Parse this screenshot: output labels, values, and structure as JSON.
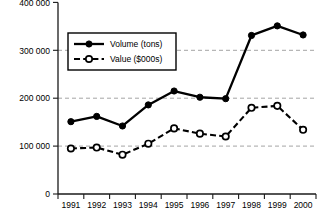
{
  "chart_data": {
    "type": "line",
    "title": "",
    "xlabel": "",
    "ylabel": "",
    "categories": [
      "1991",
      "1992",
      "1993",
      "1994",
      "1995",
      "1996",
      "1997",
      "1998",
      "1999",
      "2000"
    ],
    "series": [
      {
        "name": "Volume (tons)",
        "marker": "filled-circle",
        "linestyle": "solid",
        "color": "#000000",
        "values": [
          151000,
          162000,
          142000,
          186000,
          215000,
          202000,
          199000,
          331000,
          351000,
          332000
        ]
      },
      {
        "name": "Value ($000s)",
        "marker": "open-circle",
        "linestyle": "dashed",
        "color": "#000000",
        "values": [
          95000,
          97000,
          82000,
          105000,
          137000,
          126000,
          120000,
          180000,
          184000,
          134000
        ]
      }
    ],
    "ylim": [
      0,
      400000
    ],
    "yticks": [
      0,
      100000,
      200000,
      300000,
      400000
    ],
    "ytick_labels": [
      "0",
      "100 000",
      "200 000",
      "300 000",
      "400 000"
    ],
    "xtick_labels": [
      "1991",
      "1992",
      "1993",
      "1994",
      "1995",
      "1996",
      "1997",
      "1998",
      "1999",
      "2000"
    ],
    "grid": "horizontal-dashed",
    "legend_position": "upper-left-inside",
    "legend_entries": [
      "Volume (tons)",
      "Value ($000s)"
    ]
  },
  "axis": {
    "y_labels": {
      "t400": "400 000",
      "t300": "300 000",
      "t200": "200 000",
      "t100": "100 000",
      "t0": "0"
    },
    "x_labels": {
      "x1991": "1991",
      "x1992": "1992",
      "x1993": "1993",
      "x1994": "1994",
      "x1995": "1995",
      "x1996": "1996",
      "x1997": "1997",
      "x1998": "1998",
      "x1999": "1999",
      "x2000": "2000"
    }
  },
  "legend": {
    "volume_label": "Volume (tons)",
    "value_label": "Value ($000s)"
  },
  "colors": {
    "series": "#000000",
    "grid": "#9a9a9a",
    "axis": "#1a1a1a",
    "background": "#ffffff"
  }
}
